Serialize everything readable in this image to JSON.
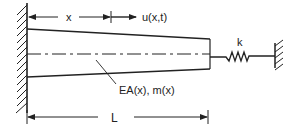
{
  "diagram": {
    "labels": {
      "x": "x",
      "displacement": "u(x,t)",
      "stiffness": "k",
      "properties": "EA(x), m(x)",
      "length": "L"
    },
    "colors": {
      "line": "#222222",
      "background": "#ffffff"
    }
  }
}
